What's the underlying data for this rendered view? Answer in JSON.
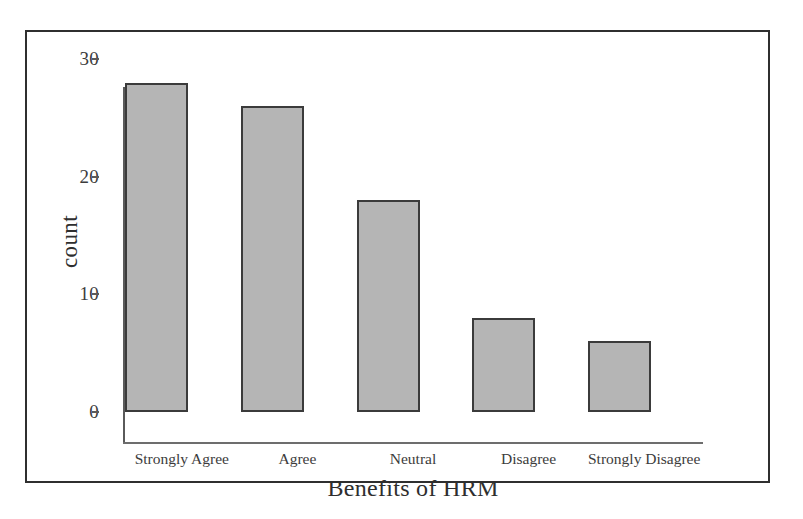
{
  "figure": {
    "background_color": "#ffffff",
    "panel_border_color": "#2f2f2f",
    "axis_color": "#5a5a5a",
    "bar_fill_color": "#b5b5b5",
    "bar_edge_color": "#3b3b3b"
  },
  "chart_data": {
    "type": "bar",
    "title": "",
    "subtitle": "",
    "xlabel": "Benefits of HRM",
    "ylabel": "count",
    "categories": [
      "Strongly Agree",
      "Agree",
      "Neutral",
      "Disagree",
      "Strongly Disagree"
    ],
    "values": [
      28,
      26,
      18,
      8,
      6
    ],
    "ylim": [
      0,
      30
    ],
    "yticks": [
      0,
      10,
      20,
      30
    ],
    "ytick_labels": [
      "0",
      "10",
      "20",
      "30"
    ],
    "grid": false,
    "legend": null,
    "annotations": []
  }
}
